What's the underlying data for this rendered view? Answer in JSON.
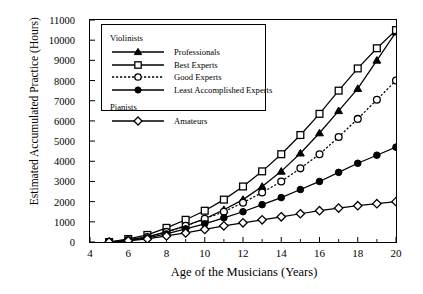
{
  "chart_data": {
    "type": "line",
    "title": "",
    "xlabel": "Age of the Musicians (Years)",
    "ylabel": "Estimated Accumulated Practice (Hours)",
    "xlim": [
      4,
      20
    ],
    "ylim": [
      0,
      11000
    ],
    "xticks": [
      4,
      6,
      8,
      10,
      12,
      14,
      16,
      18,
      20
    ],
    "xminorticks": [
      5,
      7,
      9,
      11,
      13,
      15,
      17,
      19
    ],
    "yticks": [
      0,
      1000,
      2000,
      3000,
      4000,
      5000,
      6000,
      7000,
      8000,
      9000,
      10000,
      11000
    ],
    "grid": false,
    "legend_position": "upper-left-inside",
    "x": [
      5,
      6,
      7,
      8,
      9,
      10,
      11,
      12,
      13,
      14,
      15,
      16,
      17,
      18,
      19,
      20
    ],
    "series": [
      {
        "name": "Professionals",
        "group": "Violinists",
        "marker": "filled-triangle",
        "line": "solid",
        "values": [
          0,
          100,
          250,
          500,
          800,
          1150,
          1600,
          2100,
          2750,
          3500,
          4400,
          5400,
          6500,
          7600,
          9000,
          10400
        ]
      },
      {
        "name": "Best Experts",
        "group": "Violinists",
        "marker": "open-square",
        "line": "solid",
        "values": [
          0,
          150,
          350,
          700,
          1100,
          1550,
          2100,
          2750,
          3500,
          4350,
          5300,
          6350,
          7500,
          8600,
          9600,
          10500
        ]
      },
      {
        "name": "Good Experts",
        "group": "Violinists",
        "marker": "open-circle",
        "line": "dotted",
        "values": [
          0,
          100,
          250,
          500,
          800,
          1150,
          1500,
          1950,
          2450,
          3000,
          3650,
          4350,
          5200,
          6100,
          7050,
          8000
        ]
      },
      {
        "name": "Least Accomplished Experts",
        "group": "Violinists",
        "marker": "filled-circle",
        "line": "solid",
        "values": [
          0,
          80,
          200,
          400,
          650,
          900,
          1200,
          1500,
          1850,
          2200,
          2600,
          3000,
          3450,
          3900,
          4300,
          4700
        ]
      },
      {
        "name": "Amateurs",
        "group": "Pianists",
        "marker": "open-diamond",
        "line": "solid",
        "values": [
          0,
          60,
          150,
          300,
          450,
          620,
          800,
          950,
          1100,
          1250,
          1400,
          1550,
          1680,
          1800,
          1900,
          2000
        ]
      }
    ]
  },
  "legend": {
    "groups": [
      {
        "heading": "Violinists",
        "items": [
          {
            "label": "Professionals",
            "marker": "filled-triangle",
            "line": "solid"
          },
          {
            "label": "Best Experts",
            "marker": "open-square",
            "line": "solid"
          },
          {
            "label": "Good Experts",
            "marker": "open-circle",
            "line": "dotted"
          },
          {
            "label": "Least Accomplished Experts",
            "marker": "filled-circle",
            "line": "solid"
          }
        ]
      },
      {
        "heading": "Pianists",
        "items": [
          {
            "label": "Amateurs",
            "marker": "open-diamond",
            "line": "solid"
          }
        ]
      }
    ]
  },
  "colors": {
    "ink": "#000000",
    "background": "#ffffff"
  }
}
